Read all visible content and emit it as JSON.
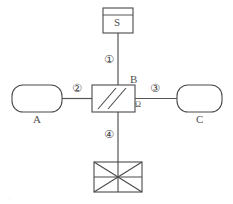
{
  "diagram": {
    "stroke_color": "#4a4a4a",
    "background_color": "#ffffff",
    "nodes": {
      "source": {
        "label": "S",
        "name": "source-vessel"
      },
      "tank_a": {
        "label": "A",
        "name": "tank-a"
      },
      "tank_c": {
        "label": "C",
        "name": "tank-c"
      },
      "valve_block": {
        "label": "B",
        "port_label": "Ω",
        "name": "valve-block-b"
      },
      "detector": {
        "label": "",
        "name": "crossed-box-unit"
      }
    },
    "flow_labels": {
      "path1": "①",
      "path2": "②",
      "path3": "③",
      "path4": "④"
    },
    "corner_mark": "."
  }
}
